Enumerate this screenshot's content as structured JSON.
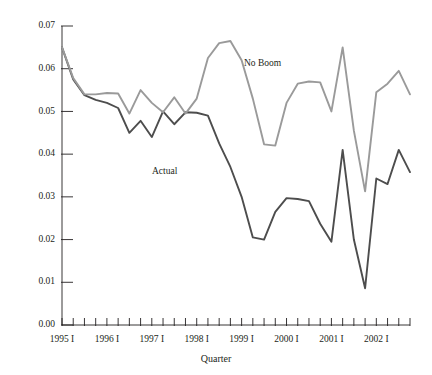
{
  "chart_data": {
    "type": "line",
    "title": "",
    "xlabel": "Quarter",
    "ylabel": "",
    "ylim": [
      0.0,
      0.07
    ],
    "ytick_values": [
      0.0,
      0.01,
      0.02,
      0.03,
      0.04,
      0.05,
      0.06,
      0.07
    ],
    "ytick_labels": [
      "0.00",
      "0.01",
      "0.02",
      "0.03",
      "0.04",
      "0.05",
      "0.06",
      "0.07"
    ],
    "grid": false,
    "legend_position": "inline-annotation",
    "x": [
      "1995 I",
      "1995 II",
      "1995 III",
      "1995 IV",
      "1996 I",
      "1996 II",
      "1996 III",
      "1996 IV",
      "1997 I",
      "1997 II",
      "1997 III",
      "1997 IV",
      "1998 I",
      "1998 II",
      "1998 III",
      "1998 IV",
      "1999 I",
      "1999 II",
      "1999 III",
      "1999 IV",
      "2000 I",
      "2000 II",
      "2000 III",
      "2000 IV",
      "2001 I",
      "2001 II",
      "2001 III",
      "2001 IV",
      "2002 I",
      "2002 II",
      "2002 III",
      "2002 IV"
    ],
    "xtick_labels_shown": [
      "1995 I",
      "1996 I",
      "1997 I",
      "1998 I",
      "1999 I",
      "2000 I",
      "2001 I",
      "2002 I"
    ],
    "series": [
      {
        "name": "Actual",
        "color": "#4d4d4d",
        "label_x": "1997 IV",
        "values": [
          0.065,
          0.0575,
          0.0538,
          0.0527,
          0.052,
          0.0508,
          0.045,
          0.0478,
          0.044,
          0.05,
          0.047,
          0.0498,
          0.0497,
          0.049,
          0.0425,
          0.037,
          0.03,
          0.0205,
          0.02,
          0.0265,
          0.0297,
          0.0295,
          0.029,
          0.0237,
          0.0195,
          0.041,
          0.02,
          0.0086,
          0.0343,
          0.033,
          0.041,
          0.0358
        ]
      },
      {
        "name": "No Boom",
        "color": "#9a9a9a",
        "label_x": "1998 IV",
        "values": [
          0.065,
          0.0578,
          0.054,
          0.054,
          0.0543,
          0.0542,
          0.0495,
          0.055,
          0.052,
          0.0498,
          0.0533,
          0.0495,
          0.053,
          0.0625,
          0.066,
          0.0665,
          0.062,
          0.053,
          0.0423,
          0.042,
          0.052,
          0.0565,
          0.057,
          0.0568,
          0.05,
          0.065,
          0.0455,
          0.0313,
          0.0545,
          0.0565,
          0.0595,
          0.054
        ]
      }
    ],
    "annotations": [
      {
        "text": "No Boom",
        "x_px": 244,
        "y_px": 66
      },
      {
        "text": "Actual",
        "x_px": 152,
        "y_px": 174
      }
    ],
    "colors": {
      "actual": "#4d4d4d",
      "no_boom": "#9a9a9a",
      "axis": "#231f20",
      "background": "#ffffff"
    }
  }
}
